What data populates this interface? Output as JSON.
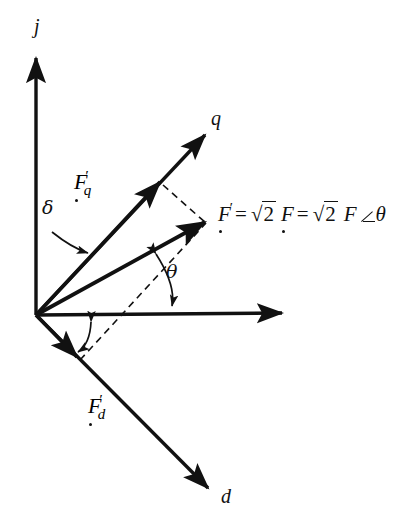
{
  "figure": {
    "type": "vector-phasor-diagram",
    "title_text": "",
    "background_color": "#ffffff",
    "stroke_color": "#111111"
  },
  "axes": {
    "vertical": {
      "label": "j",
      "from": [
        36,
        315
      ],
      "to": [
        36,
        58
      ]
    },
    "horizontal": {
      "label": "",
      "from": [
        36,
        315
      ],
      "to": [
        282,
        313
      ]
    },
    "q_axis": {
      "label": "q",
      "from": [
        36,
        315
      ],
      "to": [
        205,
        135
      ]
    },
    "d_axis": {
      "label": "d",
      "from": [
        36,
        315
      ],
      "to": [
        208,
        488
      ]
    }
  },
  "vectors": [
    {
      "name": "F_q_prime",
      "label_base": "F",
      "label_prime": "′",
      "label_sub": "q",
      "has_phasor_dot": true,
      "from": [
        36,
        315
      ],
      "to": [
        160,
        182
      ],
      "label_pos": [
        75,
        176
      ]
    },
    {
      "name": "F_prime_resultant",
      "label_base": "F",
      "label_prime": "′",
      "label_sub": "",
      "has_phasor_dot": true,
      "from": [
        36,
        315
      ],
      "to": [
        205,
        222
      ],
      "label_pos": [
        218,
        200
      ]
    },
    {
      "name": "F_d_prime",
      "label_base": "F",
      "label_prime": "′",
      "label_sub": "d",
      "has_phasor_dot": true,
      "from": [
        36,
        315
      ],
      "to": [
        77,
        357
      ],
      "label_pos": [
        90,
        400
      ]
    }
  ],
  "construction_lines": [
    {
      "name": "dashed-from-Fq-to-Fprime",
      "style": "dashed",
      "from": [
        160,
        182
      ],
      "to": [
        205,
        222
      ]
    },
    {
      "name": "dashed-from-Fd-to-Fprime",
      "style": "dashed",
      "from": [
        77,
        357
      ],
      "to": [
        205,
        222
      ]
    }
  ],
  "angles": [
    {
      "name": "delta",
      "symbol": "δ",
      "description": "angle between j-axis and q-axis",
      "label_pos": [
        46,
        209
      ],
      "leader_from": [
        56,
        228
      ],
      "leader_to": [
        86,
        247
      ]
    },
    {
      "name": "theta",
      "symbol": "θ",
      "description": "angle between horizontal axis and F' resultant",
      "label_pos": [
        168,
        271
      ],
      "arc_from": [
        157,
        249
      ],
      "arc_to": [
        171,
        313
      ]
    },
    {
      "name": "theta-lower",
      "symbol": "",
      "description": "angle arc between horizontal axis and F'_d direction",
      "label_pos": [
        0,
        0
      ],
      "arc_from": [
        92,
        318
      ],
      "arc_to": [
        74,
        352
      ]
    }
  ],
  "equation": {
    "full_text": "F′ = √2 F = √2 F ∠θ",
    "lhs": "F",
    "lhs_prime": "′",
    "eq1": "=",
    "radical1": "√",
    "radicand1": "2",
    "term1": "F",
    "eq2": "=",
    "radical2": "√",
    "radicand2": "2",
    "term2": "F",
    "angle_glyph": "∠",
    "angle_var": "θ"
  },
  "labels": {
    "j": "j",
    "q": "q",
    "d": "d",
    "delta": "δ",
    "theta": "θ",
    "F": "F",
    "prime": "′",
    "sub_q": "q",
    "sub_d": "d"
  }
}
